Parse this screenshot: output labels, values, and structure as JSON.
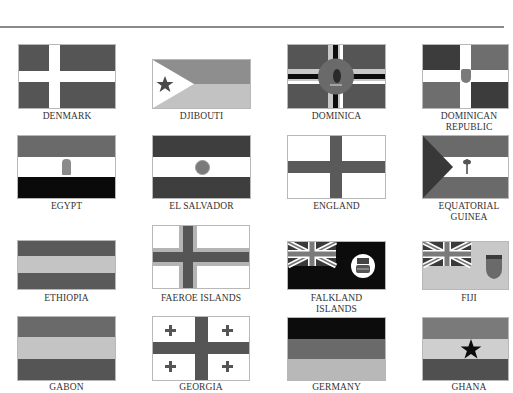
{
  "page": {
    "colors": {
      "dark": "#525252",
      "medium": "#7a7a7a",
      "light": "#b8b8b8",
      "lighter": "#cfcfcf",
      "black": "#0c0c0c",
      "white": "#ffffff",
      "rule": "#8a8a8a"
    }
  },
  "flags": [
    {
      "name": "DENMARK",
      "row": 0,
      "col": 0
    },
    {
      "name": "DJIBOUTI",
      "row": 0,
      "col": 1
    },
    {
      "name": "DOMINICA",
      "row": 0,
      "col": 2
    },
    {
      "name": "DOMINICAN\nREPUBLIC",
      "line1": "DOMINICAN",
      "line2": "REPUBLIC",
      "row": 0,
      "col": 3
    },
    {
      "name": "EGYPT",
      "row": 1,
      "col": 0
    },
    {
      "name": "EL SALVADOR",
      "row": 1,
      "col": 1
    },
    {
      "name": "ENGLAND",
      "row": 1,
      "col": 2
    },
    {
      "name": "EQUATORIAL\nGUINEA",
      "line1": "EQUATORIAL",
      "line2": "GUINEA",
      "row": 1,
      "col": 3
    },
    {
      "name": "ETHIOPIA",
      "row": 2,
      "col": 0
    },
    {
      "name": "FAEROE ISLANDS",
      "row": 2,
      "col": 1
    },
    {
      "name": "FALKLAND\nISLANDS",
      "line1": "FALKLAND",
      "line2": "ISLANDS",
      "row": 2,
      "col": 2
    },
    {
      "name": "FIJI",
      "row": 2,
      "col": 3
    },
    {
      "name": "GABON",
      "row": 3,
      "col": 0
    },
    {
      "name": "GEORGIA",
      "row": 3,
      "col": 1
    },
    {
      "name": "GERMANY",
      "row": 3,
      "col": 2
    },
    {
      "name": "GHANA",
      "row": 3,
      "col": 3
    }
  ]
}
